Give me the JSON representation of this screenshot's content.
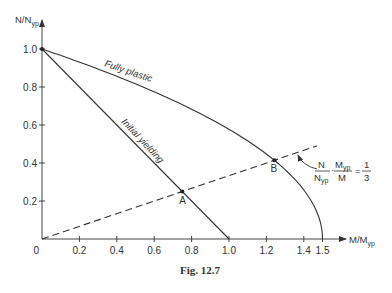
{
  "chart_data": {
    "type": "line",
    "title": "",
    "caption": "Fig. 12.7",
    "xlabel": "M/M",
    "xlabel_sub": "yp",
    "ylabel": "N/N",
    "ylabel_sub": "yp",
    "xlim": [
      0,
      1.5
    ],
    "ylim": [
      0,
      1.0
    ],
    "grid": false,
    "x_ticks": [
      {
        "value": 0,
        "label": "0"
      },
      {
        "value": 0.2,
        "label": "0.2"
      },
      {
        "value": 0.4,
        "label": "0.4"
      },
      {
        "value": 0.6,
        "label": "0.6"
      },
      {
        "value": 0.8,
        "label": "0.8"
      },
      {
        "value": 1.0,
        "label": "1.0"
      },
      {
        "value": 1.2,
        "label": "1.2"
      },
      {
        "value": 1.4,
        "label": "1.4"
      },
      {
        "value": 1.5,
        "label": "1.5"
      }
    ],
    "y_ticks": [
      {
        "value": 0.2,
        "label": "0.2"
      },
      {
        "value": 0.4,
        "label": "0.4"
      },
      {
        "value": 0.6,
        "label": "0.6"
      },
      {
        "value": 0.8,
        "label": "0.8"
      },
      {
        "value": 1.0,
        "label": "1.0"
      }
    ],
    "series": [
      {
        "name": "Fully plastic",
        "style": "solid",
        "equation": "M/Myp = 1.5(1 - (N/Nyp)^2)",
        "x": [
          1.5,
          1.485,
          1.44,
          1.365,
          1.26,
          1.125,
          0.96,
          0.765,
          0.54,
          0.285,
          0.0
        ],
        "y": [
          0.0,
          0.1,
          0.2,
          0.3,
          0.4,
          0.5,
          0.6,
          0.7,
          0.8,
          0.9,
          1.0
        ]
      },
      {
        "name": "Initial yielding",
        "style": "solid",
        "x": [
          0.0,
          1.0
        ],
        "y": [
          1.0,
          0.0
        ]
      },
      {
        "name": "N/Nyp · Myp/M = 1/3",
        "style": "dashed",
        "x": [
          0.0,
          1.47
        ],
        "y": [
          0.0,
          0.49
        ]
      }
    ],
    "points": [
      {
        "label": "A",
        "x": 0.75,
        "y": 0.25
      },
      {
        "label": "B",
        "x": 1.243,
        "y": 0.414
      },
      {
        "label": "",
        "x": 0.0,
        "y": 1.0
      }
    ],
    "annotations": [
      {
        "text": "Fully plastic",
        "target": "fully-plastic-curve"
      },
      {
        "text": "Initial yielding",
        "target": "initial-yielding-line"
      },
      {
        "text": "N/Nyp · Myp/M = 1/3",
        "numerator_left": "N",
        "denominator_left": "N",
        "denominator_left_sub": "yp",
        "numerator_right": "M",
        "numerator_right_sub": "yp",
        "denominator_right": "M",
        "equals": "=",
        "fraction_num": "1",
        "fraction_den": "3",
        "target": "dashed-line"
      }
    ]
  }
}
